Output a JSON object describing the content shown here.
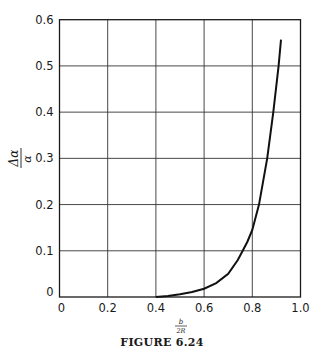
{
  "chart_data": {
    "type": "line",
    "title": "",
    "caption": "FIGURE 6.24",
    "xlabel": "b / 2R",
    "xlabel_num": "b",
    "xlabel_den": "2R",
    "ylabel": "Δα_i / α_i",
    "ylabel_num": "Δα",
    "ylabel_den": "α",
    "ylabel_sub": "i",
    "xlim": [
      0,
      1.0
    ],
    "ylim": [
      0,
      0.6
    ],
    "grid": true,
    "legend": null,
    "xticks": [
      "0",
      "0.2",
      "0.4",
      "0.6",
      "0.8",
      "1.0"
    ],
    "yticks": [
      "0",
      "0.1",
      "0.2",
      "0.3",
      "0.4",
      "0.5",
      "0.6"
    ],
    "series": [
      {
        "name": "curve",
        "x": [
          0.4,
          0.45,
          0.5,
          0.55,
          0.6,
          0.65,
          0.7,
          0.74,
          0.76,
          0.78,
          0.8,
          0.828,
          0.862,
          0.887,
          0.909,
          0.919
        ],
        "y": [
          0.0,
          0.002,
          0.006,
          0.011,
          0.018,
          0.03,
          0.05,
          0.08,
          0.1,
          0.12,
          0.145,
          0.2,
          0.3,
          0.4,
          0.5,
          0.557
        ]
      }
    ]
  }
}
